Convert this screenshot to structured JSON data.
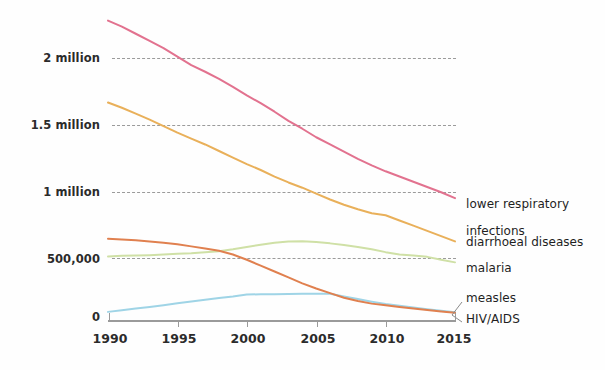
{
  "chart_data": {
    "type": "line",
    "title": "",
    "subtitle": "",
    "xlabel": "",
    "ylabel": "",
    "xlim": [
      1990,
      2015
    ],
    "ylim": [
      0,
      2400000
    ],
    "grid": "horizontal-dashed",
    "legend_position": "right-inline-labels",
    "x": [
      1990,
      1991,
      1992,
      1993,
      1994,
      1995,
      1996,
      1997,
      1998,
      1999,
      2000,
      2001,
      2002,
      2003,
      2004,
      2005,
      2006,
      2007,
      2008,
      2009,
      2010,
      2011,
      2012,
      2013,
      2014,
      2015
    ],
    "y_tick_values": [
      0,
      500000,
      1000000,
      1500000,
      2000000
    ],
    "y_tick_labels": [
      "0",
      "500,000",
      "1 million",
      "1.5 million",
      "2 million"
    ],
    "x_tick_values": [
      1990,
      1995,
      2000,
      2005,
      2010,
      2015
    ],
    "x_tick_labels": [
      "1990",
      "1995",
      "2000",
      "2005",
      "2010",
      "2015"
    ],
    "series": [
      {
        "name": "lower respiratory infections",
        "color": "#e2728f",
        "label_lines": "lower respiratory\ninfections",
        "values": [
          2285000,
          2240000,
          2185000,
          2130000,
          2075000,
          2010000,
          1945000,
          1895000,
          1840000,
          1780000,
          1715000,
          1655000,
          1590000,
          1520000,
          1460000,
          1395000,
          1340000,
          1285000,
          1230000,
          1180000,
          1135000,
          1095000,
          1055000,
          1015000,
          975000,
          930000
        ]
      },
      {
        "name": "diarrhoeal diseases",
        "color": "#e9b05a",
        "label_lines": "diarrhoeal diseases",
        "values": [
          1660000,
          1620000,
          1575000,
          1530000,
          1480000,
          1430000,
          1385000,
          1340000,
          1290000,
          1240000,
          1190000,
          1145000,
          1095000,
          1050000,
          1010000,
          965000,
          920000,
          880000,
          845000,
          815000,
          800000,
          760000,
          720000,
          680000,
          640000,
          600000
        ]
      },
      {
        "name": "malaria",
        "color": "#cfe0a6",
        "label_lines": "malaria",
        "values": [
          485000,
          490000,
          492000,
          495000,
          500000,
          505000,
          510000,
          518000,
          525000,
          540000,
          558000,
          575000,
          590000,
          600000,
          602000,
          595000,
          585000,
          572000,
          558000,
          540000,
          518000,
          500000,
          492000,
          482000,
          460000,
          440000
        ]
      },
      {
        "name": "measles",
        "color": "#9fd4e6",
        "label_lines": "measles",
        "values": [
          62000,
          75000,
          88000,
          100000,
          113000,
          128000,
          142000,
          155000,
          168000,
          180000,
          195000,
          196000,
          197000,
          199000,
          200000,
          201000,
          200000,
          180000,
          160000,
          140000,
          122000,
          108000,
          95000,
          82000,
          70000,
          60000
        ]
      },
      {
        "name": "HIV/AIDS",
        "color": "#e0804f",
        "label_lines": "HIV/AIDS",
        "values": [
          620000,
          615000,
          608000,
          600000,
          590000,
          578000,
          562000,
          545000,
          528000,
          500000,
          460000,
          415000,
          370000,
          325000,
          280000,
          240000,
          205000,
          170000,
          145000,
          125000,
          112000,
          100000,
          88000,
          76000,
          65000,
          55000
        ]
      }
    ],
    "annotations": [
      {
        "name": "measles-leader",
        "text": ""
      },
      {
        "name": "hivaids-leader",
        "text": ""
      }
    ]
  },
  "axis": {
    "y_labels": [
      {
        "text": "2 million",
        "value": 2000000
      },
      {
        "text": "1.5 million",
        "value": 1500000
      },
      {
        "text": "1 million",
        "value": 1000000
      },
      {
        "text": "500,000",
        "value": 500000
      },
      {
        "text": "0",
        "value": 0
      }
    ],
    "x_labels": [
      {
        "text": "1990",
        "value": 1990
      },
      {
        "text": "1995",
        "value": 1995
      },
      {
        "text": "2000",
        "value": 2000
      },
      {
        "text": "2005",
        "value": 2005
      },
      {
        "text": "2010",
        "value": 2010
      },
      {
        "text": "2015",
        "value": 2015
      }
    ]
  },
  "legend": {
    "items": [
      {
        "label": "lower respiratory",
        "label2": "infections",
        "color": "#e2728f"
      },
      {
        "label": "diarrhoeal diseases",
        "label2": "",
        "color": "#e9b05a"
      },
      {
        "label": "malaria",
        "label2": "",
        "color": "#cfe0a6"
      },
      {
        "label": "measles",
        "label2": "",
        "color": "#9fd4e6"
      },
      {
        "label": "HIV/AIDS",
        "label2": "",
        "color": "#e0804f"
      }
    ]
  }
}
